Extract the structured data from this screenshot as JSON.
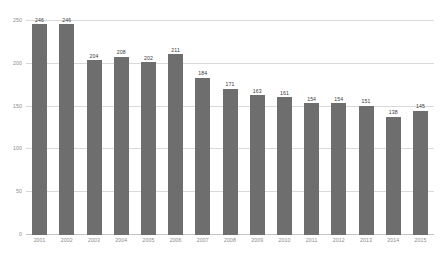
{
  "chart_data": {
    "type": "bar",
    "title": "",
    "subtitle": "",
    "xlabel": "",
    "ylabel": "",
    "categories": [
      "2001",
      "2002",
      "2003",
      "2004",
      "2005",
      "2006",
      "2007",
      "2008",
      "2009",
      "2010",
      "2011",
      "2012",
      "2013",
      "2014",
      "2015"
    ],
    "values": [
      246,
      246,
      204,
      208,
      202,
      211,
      184,
      171,
      163,
      161,
      154,
      154,
      151,
      138,
      145
    ],
    "data_labels": [
      "246",
      "246",
      "204",
      "208",
      "202",
      "211",
      "184",
      "171",
      "163",
      "161",
      "154",
      "154",
      "151",
      "138",
      "145"
    ],
    "ylim": [
      0,
      250
    ],
    "yticks": [
      0,
      50,
      100,
      150,
      200,
      250
    ],
    "ytick_labels": [
      "0",
      "50",
      "100",
      "150",
      "200",
      "250"
    ],
    "grid": true,
    "legend": false,
    "legend_position": "none",
    "series": [
      {
        "name": "",
        "color": "#6e6e6e",
        "values": [
          246,
          246,
          204,
          208,
          202,
          211,
          184,
          171,
          163,
          161,
          154,
          154,
          151,
          138,
          145
        ]
      }
    ]
  },
  "style": {
    "background": "#ffffff",
    "bar_color": "#6e6e6e",
    "grid_color": "#d9d9d9",
    "tick_text_color": "#8a8a8a",
    "label_text_color": "#3a3a3a"
  }
}
